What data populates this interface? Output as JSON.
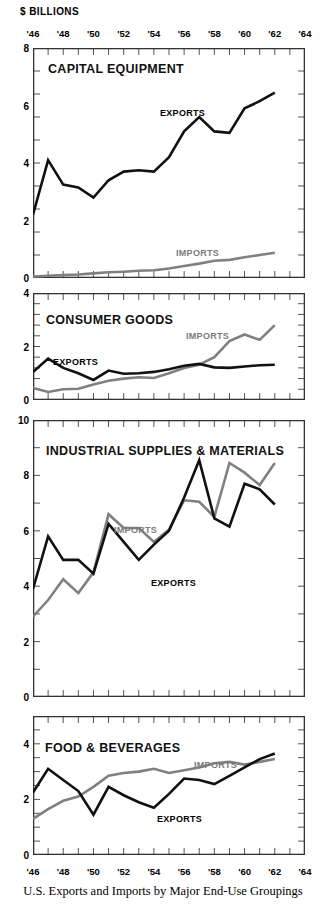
{
  "units_label": "$ BILLIONS",
  "footer_caption": "U.S. Exports and Imports by Major End-Use Groupings",
  "colors": {
    "exports": "#111111",
    "imports": "#808080",
    "frame": "#333333",
    "tick": "#555555",
    "background": "#ffffff"
  },
  "axis": {
    "year_ticks": [
      "'46",
      "'48",
      "'50",
      "'52",
      "'54",
      "'56",
      "'58",
      "'60",
      "'62",
      "'64"
    ],
    "year_tick_values": [
      1946,
      1948,
      1950,
      1952,
      1954,
      1956,
      1958,
      1960,
      1962,
      1964
    ],
    "xlim": [
      1946,
      1964
    ],
    "minor_tick_step": 1
  },
  "legend": {
    "exports": "EXPORTS",
    "imports": "IMPORTS"
  },
  "chart_data": [
    {
      "type": "line",
      "title": "CAPITAL EQUIPMENT",
      "xlabel": "",
      "ylabel": "$ BILLIONS",
      "ylim": [
        0,
        8
      ],
      "yticks": [
        0,
        2,
        4,
        6,
        8
      ],
      "ytick_labels": [
        "0",
        "2",
        "4",
        "6",
        "8"
      ],
      "xlim": [
        1946,
        1964
      ],
      "grid": false,
      "legend_position": "inline-annotations",
      "x": [
        1946,
        1947,
        1948,
        1949,
        1950,
        1951,
        1952,
        1953,
        1954,
        1955,
        1956,
        1957,
        1958,
        1959,
        1960,
        1961,
        1962
      ],
      "series": [
        {
          "name": "EXPORTS",
          "color": "#111111",
          "values": [
            2.2,
            4.1,
            3.25,
            3.15,
            2.8,
            3.4,
            3.7,
            3.75,
            3.7,
            4.2,
            5.1,
            5.6,
            5.1,
            5.05,
            5.9,
            6.15,
            6.45
          ]
        },
        {
          "name": "IMPORTS",
          "color": "#808080",
          "values": [
            0.05,
            0.08,
            0.1,
            0.12,
            0.16,
            0.2,
            0.22,
            0.25,
            0.27,
            0.33,
            0.42,
            0.5,
            0.6,
            0.63,
            0.72,
            0.8,
            0.88
          ]
        }
      ]
    },
    {
      "type": "line",
      "title": "CONSUMER GOODS",
      "xlabel": "",
      "ylabel": "",
      "ylim": [
        0,
        4
      ],
      "yticks": [
        0,
        2,
        4
      ],
      "ytick_labels": [
        "0",
        "2",
        "4"
      ],
      "xlim": [
        1946,
        1964
      ],
      "grid": false,
      "legend_position": "inline-annotations",
      "x": [
        1946,
        1947,
        1948,
        1949,
        1950,
        1951,
        1952,
        1953,
        1954,
        1955,
        1956,
        1957,
        1958,
        1959,
        1960,
        1961,
        1962
      ],
      "series": [
        {
          "name": "EXPORTS",
          "color": "#111111",
          "values": [
            1.05,
            1.55,
            1.2,
            1.0,
            0.75,
            1.1,
            0.98,
            1.0,
            1.05,
            1.15,
            1.28,
            1.35,
            1.22,
            1.2,
            1.25,
            1.3,
            1.32
          ]
        },
        {
          "name": "IMPORTS",
          "color": "#808080",
          "values": [
            0.45,
            0.3,
            0.4,
            0.42,
            0.58,
            0.72,
            0.8,
            0.85,
            0.82,
            1.0,
            1.2,
            1.32,
            1.6,
            2.2,
            2.45,
            2.25,
            2.8
          ]
        }
      ]
    },
    {
      "type": "line",
      "title": "INDUSTRIAL SUPPLIES & MATERIALS",
      "xlabel": "",
      "ylabel": "",
      "ylim": [
        0,
        10
      ],
      "yticks": [
        0,
        2,
        4,
        6,
        8,
        10
      ],
      "ytick_labels": [
        "0",
        "2",
        "4",
        "6",
        "8",
        "10"
      ],
      "xlim": [
        1946,
        1964
      ],
      "grid": false,
      "legend_position": "inline-annotations",
      "x": [
        1946,
        1947,
        1948,
        1949,
        1950,
        1951,
        1952,
        1953,
        1954,
        1955,
        1956,
        1957,
        1958,
        1959,
        1960,
        1961,
        1962
      ],
      "series": [
        {
          "name": "EXPORTS",
          "color": "#111111",
          "values": [
            3.9,
            5.8,
            4.95,
            4.95,
            4.45,
            6.25,
            5.6,
            4.95,
            5.5,
            6.0,
            7.2,
            8.55,
            6.45,
            6.15,
            7.7,
            7.5,
            6.95
          ]
        },
        {
          "name": "IMPORTS",
          "color": "#808080",
          "values": [
            2.9,
            3.5,
            4.25,
            3.75,
            4.5,
            6.6,
            6.1,
            6.1,
            5.6,
            6.05,
            7.1,
            7.05,
            6.5,
            8.45,
            8.1,
            7.65,
            8.45
          ]
        }
      ]
    },
    {
      "type": "line",
      "title": "FOOD & BEVERAGES",
      "xlabel": "",
      "ylabel": "",
      "ylim": [
        0,
        5
      ],
      "yticks": [
        0,
        2,
        4
      ],
      "ytick_labels": [
        "0",
        "2",
        "4"
      ],
      "xlim": [
        1946,
        1964
      ],
      "grid": false,
      "legend_position": "inline-annotations",
      "x": [
        1946,
        1947,
        1948,
        1949,
        1950,
        1951,
        1952,
        1953,
        1954,
        1955,
        1956,
        1957,
        1958,
        1959,
        1960,
        1961,
        1962
      ],
      "series": [
        {
          "name": "EXPORTS",
          "color": "#111111",
          "values": [
            2.25,
            3.1,
            2.7,
            2.3,
            1.45,
            2.45,
            2.15,
            1.9,
            1.7,
            2.2,
            2.75,
            2.7,
            2.55,
            2.85,
            3.15,
            3.45,
            3.65
          ]
        },
        {
          "name": "IMPORTS",
          "color": "#808080",
          "values": [
            1.3,
            1.65,
            1.95,
            2.1,
            2.45,
            2.85,
            2.95,
            3.0,
            3.1,
            2.95,
            3.05,
            3.15,
            3.3,
            3.35,
            3.25,
            3.35,
            3.45
          ]
        }
      ]
    }
  ],
  "panels_layout": [
    {
      "key": "capital-equipment",
      "left": 33,
      "top": 48,
      "width": 272,
      "height": 230,
      "title_x": 48,
      "title_y": 62,
      "exports_label_x": 160,
      "exports_label_y": 108,
      "imports_label_x": 176,
      "imports_label_y": 248
    },
    {
      "key": "consumer-goods",
      "left": 33,
      "top": 293,
      "width": 272,
      "height": 107,
      "title_x": 46,
      "title_y": 313,
      "exports_label_x": 53,
      "exports_label_y": 357,
      "imports_label_x": 186,
      "imports_label_y": 331
    },
    {
      "key": "industrial-supplies",
      "left": 33,
      "top": 420,
      "width": 272,
      "height": 277,
      "title_x": 46,
      "title_y": 444,
      "exports_label_x": 151,
      "exports_label_y": 578,
      "imports_label_x": 114,
      "imports_label_y": 525
    },
    {
      "key": "food-beverages",
      "left": 33,
      "top": 716,
      "width": 272,
      "height": 139,
      "title_x": 45,
      "title_y": 741,
      "exports_label_x": 157,
      "exports_label_y": 814,
      "imports_label_x": 194,
      "imports_label_y": 760
    }
  ]
}
